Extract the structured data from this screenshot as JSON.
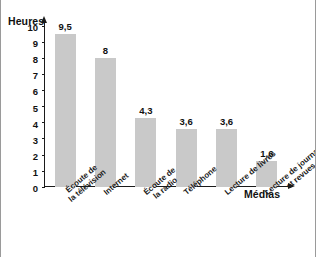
{
  "chart_data": {
    "type": "bar",
    "title": "",
    "xlabel": "Médias",
    "ylabel": "Heures",
    "ylim": [
      0,
      10
    ],
    "yticks": [
      "0",
      "1",
      "2",
      "3",
      "4",
      "5",
      "6",
      "7",
      "8",
      "9",
      "10"
    ],
    "grid": false,
    "legend": null,
    "categories": [
      "Écoute de la télévision",
      "Internet",
      "Écoute de la radio",
      "Téléphone",
      "Lecture de livres",
      "Lecture de journaux et revues"
    ],
    "category_lines": [
      [
        "Écoute de",
        "la télévision"
      ],
      [
        "Internet"
      ],
      [
        "Écoute de",
        "la radio"
      ],
      [
        "Téléphone"
      ],
      [
        "Lecture de livres"
      ],
      [
        "Lecture de journaux",
        "et revues"
      ]
    ],
    "values": [
      9.5,
      8,
      4.3,
      3.6,
      3.6,
      1.6
    ],
    "value_labels": [
      "9,5",
      "8",
      "4,3",
      "3,6",
      "3,6",
      "1,6"
    ],
    "bar_color": "#c9c9c9",
    "axis_color": "#1a1a1a"
  }
}
